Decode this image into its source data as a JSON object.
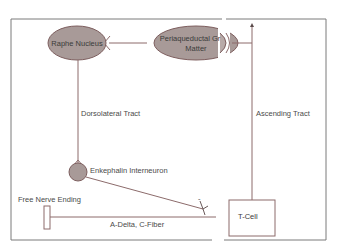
{
  "diagram": {
    "colors": {
      "line": "#8c6b6b",
      "border": "#7a7a7a",
      "node_fill": "#a89a98",
      "node_stroke": "#7d5e5e",
      "text": "#4a4a4a"
    },
    "nodes": {
      "raphe": {
        "label": "Raphe Nucleus",
        "shape": "ellipse"
      },
      "pag": {
        "label_line1": "Periaqueductal Gr",
        "label_line2": "Matter",
        "shape": "ellipse"
      },
      "enkephalin": {
        "label": "Enkephalin Interneuron",
        "shape": "circle"
      },
      "free_nerve": {
        "label": "Free Nerve Ending",
        "shape": "rectangle"
      },
      "tcell": {
        "label": "T-Cell",
        "shape": "rectangle"
      }
    },
    "edges": {
      "dorsolateral": {
        "label": "Dorsolateral Tract"
      },
      "ascending": {
        "label": "Ascending Tract"
      },
      "afferent": {
        "label": "A-Delta, C-Fiber"
      },
      "inhibitory": {
        "label": "-"
      }
    }
  }
}
